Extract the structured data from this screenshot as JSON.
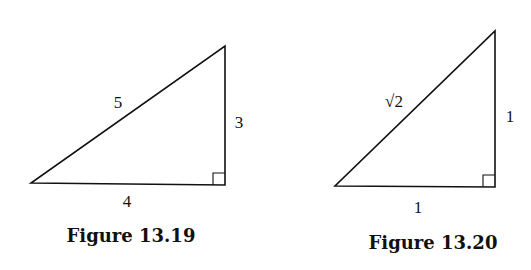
{
  "figures": [
    {
      "caption": "Figure 13.19",
      "hypotenuse_label": "5",
      "vertical_leg_label": "3",
      "horizontal_leg_label": "4",
      "right_angle": true
    },
    {
      "caption": "Figure 13.20",
      "hypotenuse_label": "√2",
      "vertical_leg_label": "1",
      "horizontal_leg_label": "1",
      "right_angle": true
    }
  ]
}
